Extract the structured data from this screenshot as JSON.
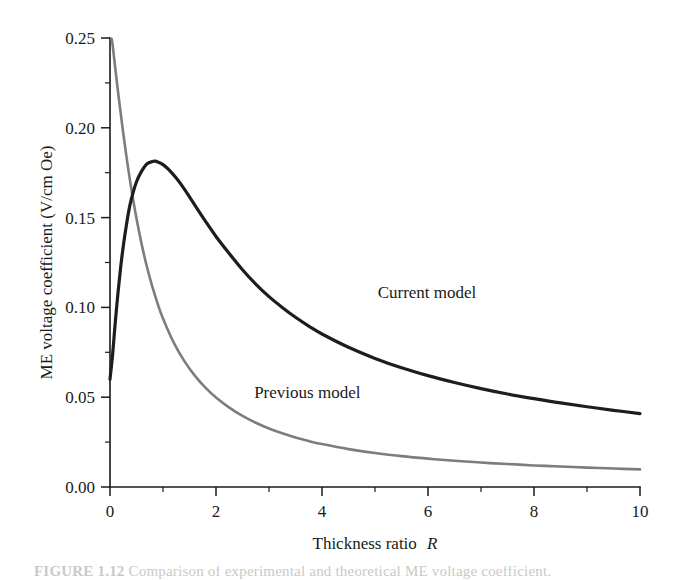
{
  "figure": {
    "caption": "FIGURE 1.12  Comparison of experimental and theoretical ME voltage coefficient.",
    "caption_prefix": "FIGURE 1.12"
  },
  "chart_data": {
    "type": "line",
    "title": "",
    "xlabel": "Thickness ratio",
    "xlabel_symbol": "R",
    "ylabel": "ME voltage coefficient (V/cm Oe)",
    "xlim": [
      0,
      10
    ],
    "ylim": [
      0.0,
      0.25
    ],
    "grid": false,
    "legend_position": "inline-annotation",
    "x_ticks": [
      0,
      2,
      4,
      6,
      8,
      10
    ],
    "x_tick_labels": [
      "0",
      "2",
      "4",
      "6",
      "8",
      "10"
    ],
    "x_minor_step": 1,
    "y_ticks": [
      0.0,
      0.05,
      0.1,
      0.15,
      0.2,
      0.25
    ],
    "y_tick_labels": [
      "0.00",
      "0.05",
      "0.10",
      "0.15",
      "0.20",
      "0.25"
    ],
    "y_minor_step": 0.025,
    "series": [
      {
        "name": "Current model",
        "color": "#1d1d1d",
        "width": 3.2,
        "label_x": 5.05,
        "label_y": 0.1055,
        "x": [
          0.0,
          0.05,
          0.1,
          0.15,
          0.2,
          0.25,
          0.3,
          0.35,
          0.4,
          0.5,
          0.6,
          0.7,
          0.8,
          0.85,
          0.9,
          1.0,
          1.1,
          1.25,
          1.4,
          1.6,
          1.8,
          2.0,
          2.25,
          2.5,
          2.75,
          3.0,
          3.25,
          3.5,
          3.75,
          4.0,
          4.5,
          5.0,
          5.5,
          6.0,
          6.5,
          7.0,
          7.5,
          8.0,
          8.5,
          9.0,
          9.5,
          10.0
        ],
        "y": [
          0.06,
          0.074,
          0.092,
          0.108,
          0.122,
          0.134,
          0.144,
          0.153,
          0.16,
          0.17,
          0.176,
          0.18,
          0.1812,
          0.1814,
          0.181,
          0.1795,
          0.177,
          0.172,
          0.166,
          0.157,
          0.148,
          0.1395,
          0.13,
          0.121,
          0.113,
          0.106,
          0.1,
          0.0945,
          0.0896,
          0.0852,
          0.0778,
          0.0716,
          0.0664,
          0.062,
          0.0582,
          0.0548,
          0.0518,
          0.0492,
          0.0468,
          0.0447,
          0.0427,
          0.0409
        ]
      },
      {
        "name": "Previous model",
        "color": "#7d7d7d",
        "width": 2.6,
        "label_x": 2.72,
        "label_y": 0.0495,
        "x": [
          0.03,
          0.05,
          0.1,
          0.15,
          0.2,
          0.25,
          0.3,
          0.35,
          0.4,
          0.5,
          0.6,
          0.7,
          0.8,
          0.9,
          1.0,
          1.2,
          1.4,
          1.6,
          1.8,
          2.0,
          2.25,
          2.5,
          2.75,
          3.0,
          3.25,
          3.5,
          3.75,
          4.0,
          4.5,
          5.0,
          5.5,
          6.0,
          6.5,
          7.0,
          7.5,
          8.0,
          8.5,
          9.0,
          9.5,
          10.0
        ],
        "y": [
          0.2495,
          0.246,
          0.233,
          0.2205,
          0.2085,
          0.197,
          0.1862,
          0.176,
          0.1665,
          0.1495,
          0.1348,
          0.1222,
          0.1114,
          0.102,
          0.0938,
          0.0805,
          0.0702,
          0.062,
          0.0553,
          0.0498,
          0.0442,
          0.0396,
          0.0358,
          0.0326,
          0.0299,
          0.0276,
          0.0256,
          0.0239,
          0.0211,
          0.0189,
          0.0172,
          0.0158,
          0.0146,
          0.0136,
          0.0128,
          0.012,
          0.0114,
          0.0108,
          0.0103,
          0.0098
        ]
      }
    ]
  }
}
